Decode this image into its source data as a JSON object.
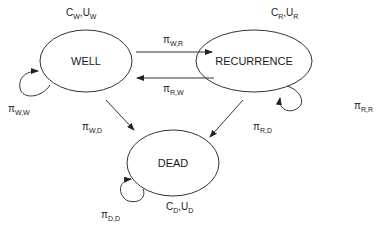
{
  "diagram": {
    "type": "state-transition",
    "nodes": [
      {
        "id": "well",
        "label": "WELL",
        "cost": "C",
        "cost_sub": "W",
        "util": "U",
        "util_sub": "W"
      },
      {
        "id": "recurrence",
        "label": "RECURRENCE",
        "cost": "C",
        "cost_sub": "R",
        "util": "U",
        "util_sub": "R"
      },
      {
        "id": "dead",
        "label": "DEAD",
        "cost": "C",
        "cost_sub": "D",
        "util": "U",
        "util_sub": "D"
      }
    ],
    "edges": [
      {
        "from": "well",
        "to": "recurrence",
        "symbol": "π",
        "sub": "W,R"
      },
      {
        "from": "recurrence",
        "to": "well",
        "symbol": "π",
        "sub": "R,W"
      },
      {
        "from": "well",
        "to": "well",
        "symbol": "π",
        "sub": "W,W"
      },
      {
        "from": "recurrence",
        "to": "recurrence",
        "symbol": "π",
        "sub": "R,R"
      },
      {
        "from": "well",
        "to": "dead",
        "symbol": "π",
        "sub": "W,D"
      },
      {
        "from": "recurrence",
        "to": "dead",
        "symbol": "π",
        "sub": "R,D"
      },
      {
        "from": "dead",
        "to": "dead",
        "symbol": "π",
        "sub": "D,D"
      }
    ],
    "param_separator": ","
  }
}
